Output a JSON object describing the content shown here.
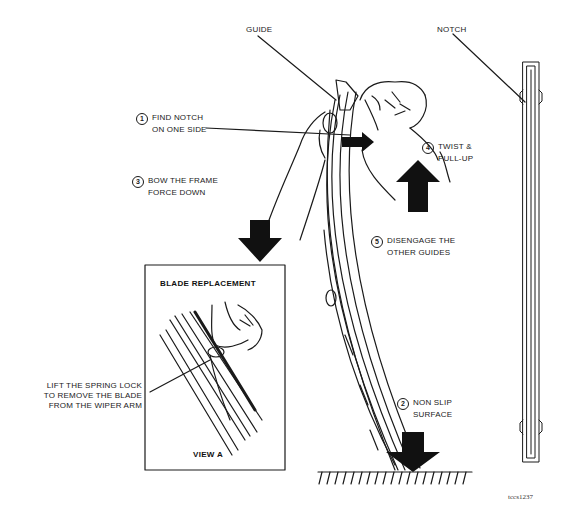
{
  "figure": {
    "code": "tccs1237"
  },
  "labels": {
    "guide": "GUIDE",
    "notch": "NOTCH",
    "step1": {
      "number": "1",
      "line1": "FIND NOTCH",
      "line2": "ON ONE SIDE"
    },
    "step2": {
      "number": "2",
      "line1": "NON SLIP",
      "line2": "SURFACE"
    },
    "step3": {
      "number": "3",
      "line1": "BOW THE FRAME",
      "line2": "FORCE DOWN"
    },
    "step4": {
      "number": "4",
      "line1": "TWIST &",
      "line2": "PULL-UP"
    },
    "step5": {
      "number": "5",
      "line1": "DISENGAGE THE",
      "line2": "OTHER GUIDES"
    },
    "spring_lock": {
      "line1": "LIFT THE SPRING LOCK",
      "line2": "TO REMOVE THE BLADE",
      "line3": "FROM THE WIPER ARM"
    }
  },
  "inset": {
    "title": "BLADE REPLACEMENT",
    "caption": "VIEW A"
  },
  "icons": {
    "down_arrow": "down-arrow",
    "up_arrow": "up-arrow",
    "right_arrow": "right-arrow"
  },
  "colors": {
    "ink": "#111111",
    "background": "#ffffff"
  }
}
